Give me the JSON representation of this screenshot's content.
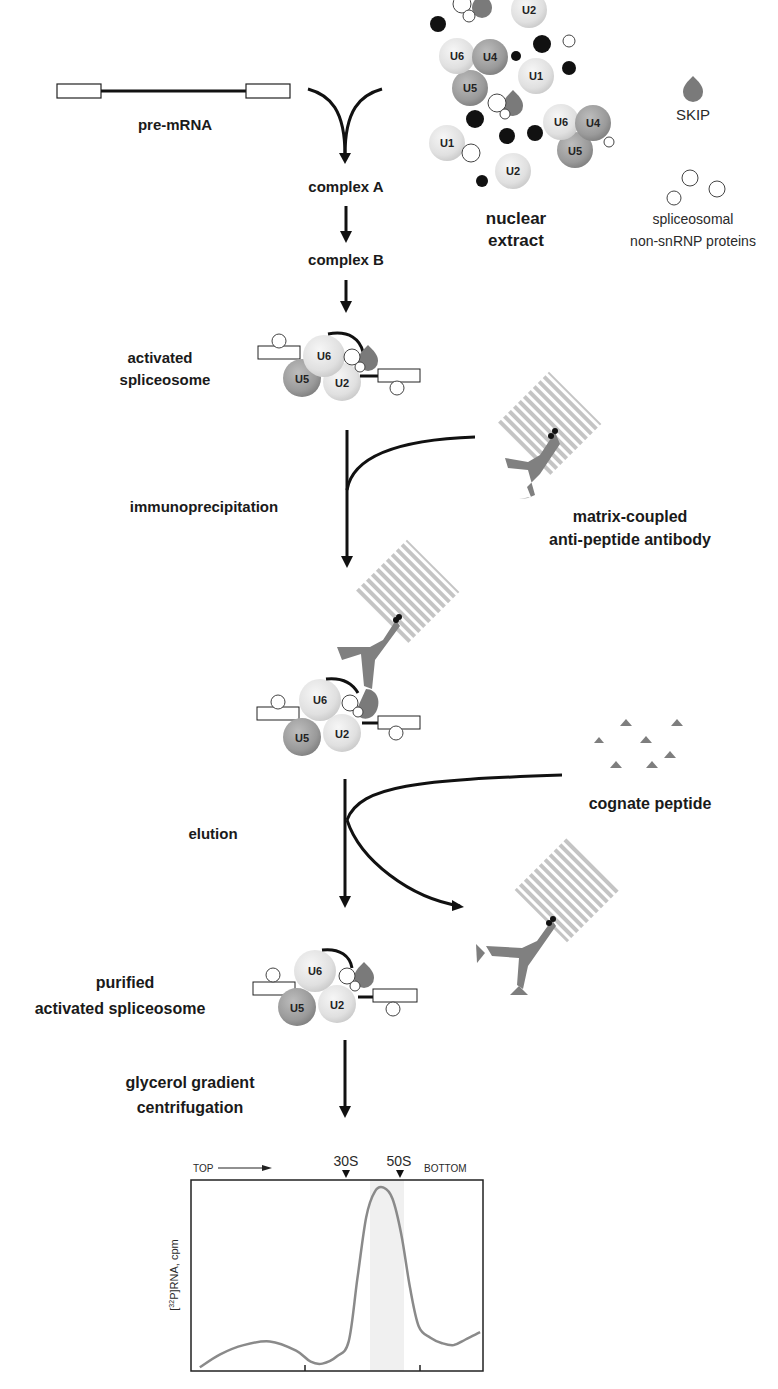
{
  "labels": {
    "pre_mrna": "pre-mRNA",
    "complex_a": "complex A",
    "complex_b": "complex B",
    "nuclear_extract_1": "nuclear",
    "nuclear_extract_2": "extract",
    "skip": "SKIP",
    "non_snrnp_1": "spliceosomal",
    "non_snrnp_2": "non-snRNP proteins",
    "activated_1": "activated",
    "activated_2": "spliceosome",
    "immunoprecipitation": "immunoprecipitation",
    "antibody_1": "matrix-coupled",
    "antibody_2": "anti-peptide antibody",
    "cognate_peptide": "cognate peptide",
    "elution": "elution",
    "purified_1": "purified",
    "purified_2": "activated spliceosome",
    "glycerol_1": "glycerol gradient",
    "glycerol_2": "centrifugation"
  },
  "snrnps": {
    "u1": "U1",
    "u2": "U2",
    "u4": "U4",
    "u5": "U5",
    "u6": "U6"
  },
  "colors": {
    "light_snrnp": "#e4e4e4",
    "dark_snrnp": "#9a9a9a",
    "skip": "#7a7a7a",
    "antibody": "#808080",
    "matrix_stripe": "#c4c4c4",
    "peptide": "#7e7e7e",
    "curve": "#8a8a8a",
    "arrow": "#111111"
  },
  "chart_data": {
    "type": "line",
    "title": "",
    "ylabel": "[32P]RNA, cpm",
    "xlabel": "",
    "top_label": "TOP",
    "bottom_label": "BOTTOM",
    "markers": [
      {
        "label": "30S",
        "x_frac": 0.53
      },
      {
        "label": "50S",
        "x_frac": 0.72
      }
    ],
    "shaded_region_frac": [
      0.61,
      0.73
    ],
    "x_frac": [
      0.03,
      0.1,
      0.18,
      0.27,
      0.36,
      0.41,
      0.45,
      0.5,
      0.54,
      0.57,
      0.6,
      0.63,
      0.66,
      0.69,
      0.72,
      0.75,
      0.78,
      0.82,
      0.86,
      0.9,
      0.94,
      0.99
    ],
    "y_frac": [
      0.02,
      0.09,
      0.14,
      0.16,
      0.11,
      0.05,
      0.04,
      0.08,
      0.16,
      0.5,
      0.83,
      0.97,
      0.99,
      0.93,
      0.74,
      0.45,
      0.24,
      0.18,
      0.15,
      0.14,
      0.17,
      0.21
    ],
    "ylim": [
      0,
      1
    ],
    "grid": false
  },
  "chart_labels": {
    "top": "TOP",
    "bottom": "BOTTOM",
    "m30": "30S",
    "m50": "50S",
    "ylabel_sup": "32",
    "ylabel_pre": "[",
    "ylabel_post": "P]RNA, cpm"
  }
}
